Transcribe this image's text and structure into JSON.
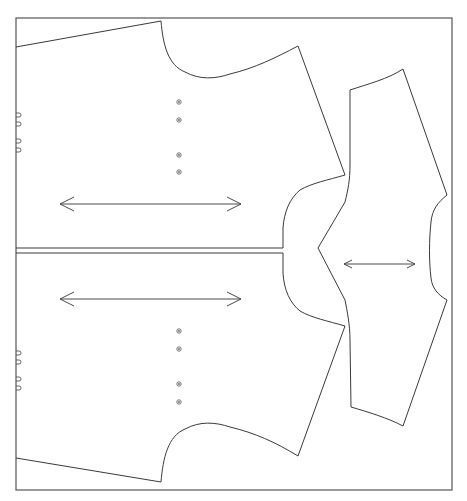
{
  "diagram": {
    "type": "sewing-pattern-layout",
    "canvas": {
      "width": 467,
      "height": 501,
      "background": "#ffffff"
    },
    "frame": {
      "x": 16,
      "y": 18,
      "width": 436,
      "height": 472,
      "stroke": "#555555"
    },
    "pieces": [
      {
        "name": "upper-bodice-piece",
        "grainline": {
          "x1": 60,
          "y1": 204,
          "x2": 241,
          "y2": 204
        },
        "button_markers": [
          [
            179,
            102
          ],
          [
            179,
            120
          ],
          [
            179,
            155
          ],
          [
            179,
            172
          ]
        ],
        "notches": [
          [
            18,
            115
          ],
          [
            18,
            124
          ],
          [
            18,
            141
          ],
          [
            18,
            150
          ]
        ]
      },
      {
        "name": "lower-bodice-piece",
        "grainline": {
          "x1": 60,
          "y1": 299,
          "x2": 241,
          "y2": 299
        },
        "button_markers": [
          [
            179,
            331
          ],
          [
            179,
            349
          ],
          [
            179,
            384
          ],
          [
            179,
            402
          ]
        ],
        "notches": [
          [
            18,
            353
          ],
          [
            18,
            362
          ],
          [
            18,
            379
          ],
          [
            18,
            388
          ]
        ]
      },
      {
        "name": "sleeve-piece",
        "grainline": {
          "x1": 344,
          "y1": 264,
          "x2": 415,
          "y2": 264
        }
      }
    ],
    "fold_line": {
      "y_top": 248,
      "y_bottom": 253,
      "x_start": 16,
      "x_end": 283
    },
    "stroke_color": "#3a3a3a"
  }
}
